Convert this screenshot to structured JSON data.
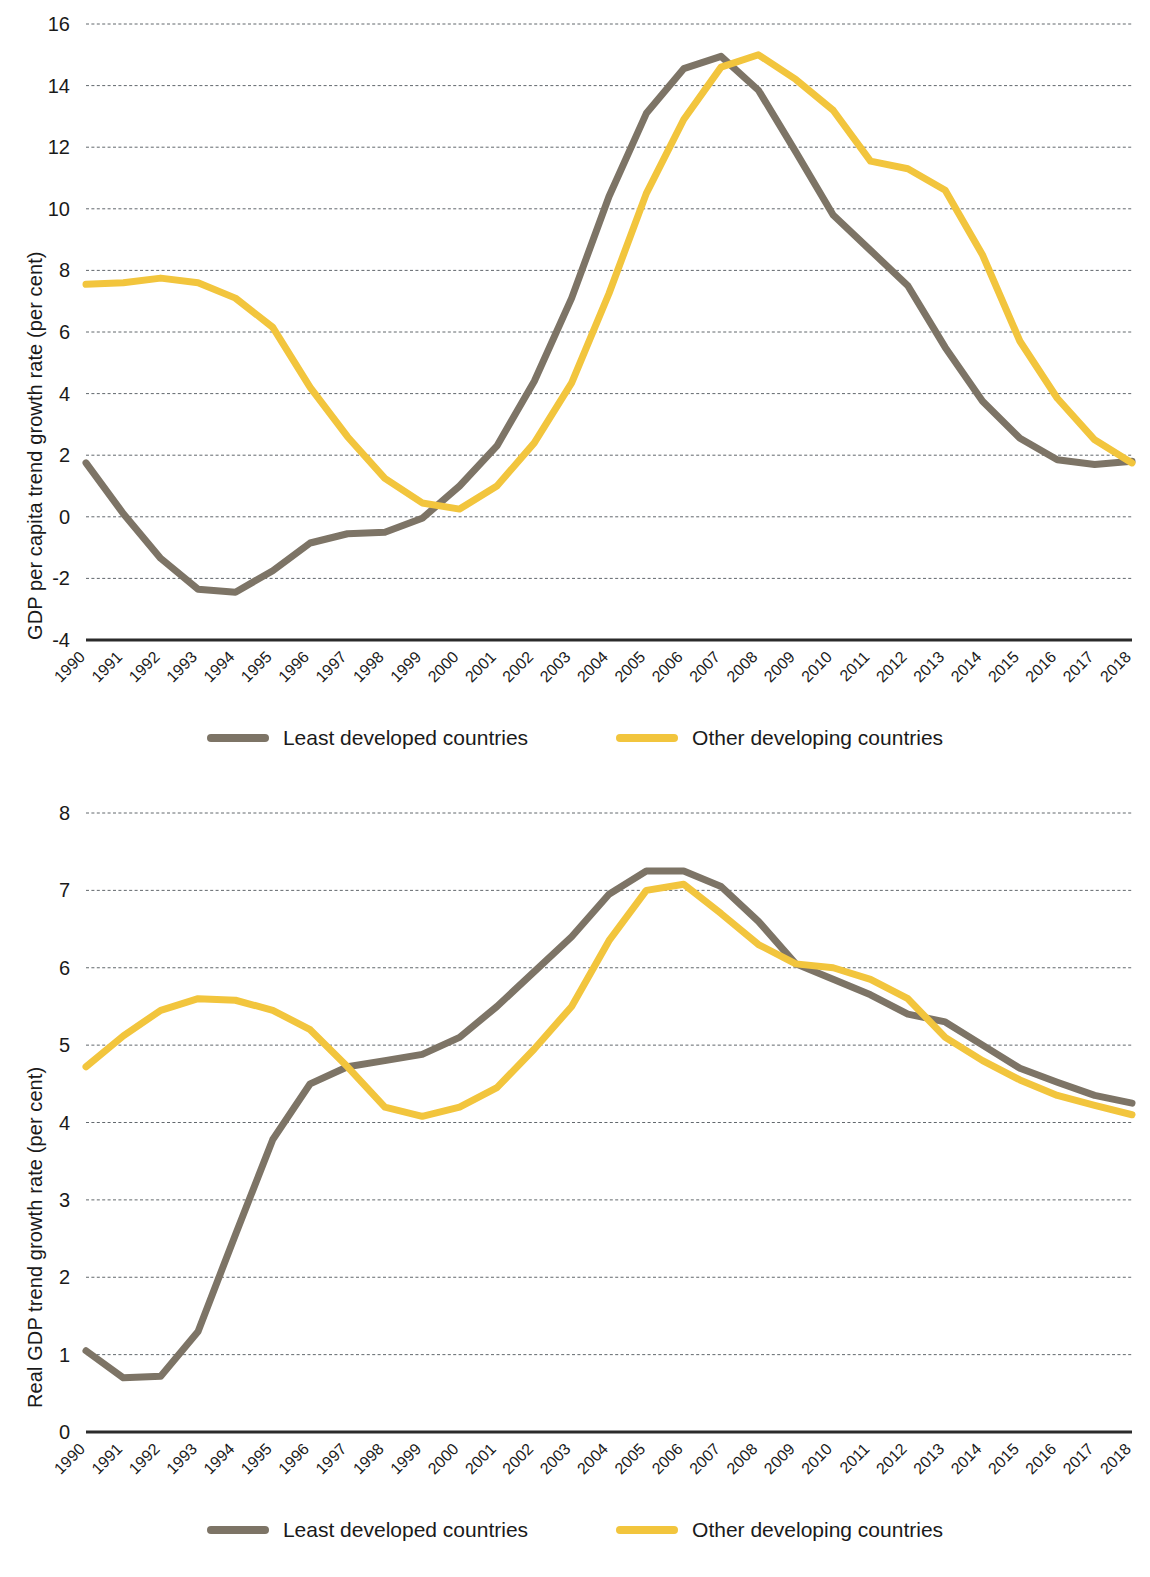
{
  "charts": [
    {
      "id": "gdp-per-capita-trend",
      "ylabel": "GDP per capita trend growth rate (per cent)",
      "yticks": [
        "16",
        "14",
        "12",
        "10",
        "8",
        "6",
        "4",
        "2",
        "0",
        "-2",
        "-4"
      ],
      "legend": [
        {
          "label": "Least developed countries",
          "color": "#7d7466"
        },
        {
          "label": "Other developing countries",
          "color": "#f2c53d"
        }
      ]
    },
    {
      "id": "real-gdp-trend",
      "ylabel": "Real GDP trend growth rate (per cent)",
      "yticks": [
        "8",
        "7",
        "6",
        "5",
        "4",
        "3",
        "2",
        "1",
        "0"
      ],
      "legend": [
        {
          "label": "Least developed countries",
          "color": "#7d7466"
        },
        {
          "label": "Other developing countries",
          "color": "#f2c53d"
        }
      ]
    }
  ],
  "colors": {
    "least_developed": "#7d7466",
    "other_developing": "#f2c53d",
    "gridline": "#5a6066",
    "axis": "#2b2b2b",
    "text": "#1a1a1a"
  },
  "chart_data": [
    {
      "type": "line",
      "title": "",
      "xlabel": "",
      "ylabel": "GDP per capita trend growth rate (per cent)",
      "grid": true,
      "legend_position": "bottom",
      "ylim": [
        -4,
        16
      ],
      "yticks": [
        -4,
        -2,
        0,
        2,
        4,
        6,
        8,
        10,
        12,
        14,
        16
      ],
      "categories": [
        "1990",
        "1991",
        "1992",
        "1993",
        "1994",
        "1995",
        "1996",
        "1997",
        "1998",
        "1999",
        "2000",
        "2001",
        "2002",
        "2003",
        "2004",
        "2005",
        "2006",
        "2007",
        "2008",
        "2009",
        "2010",
        "2011",
        "2012",
        "2013",
        "2014",
        "2015",
        "2016",
        "2017",
        "2018"
      ],
      "series": [
        {
          "name": "Least developed countries",
          "color": "#7d7466",
          "values": [
            1.75,
            0.1,
            -1.35,
            -2.35,
            -2.45,
            -1.75,
            -0.85,
            -0.55,
            -0.5,
            -0.05,
            1.0,
            2.3,
            4.4,
            7.1,
            10.4,
            13.1,
            14.55,
            14.95,
            13.85,
            11.85,
            9.8,
            8.65,
            7.5,
            5.5,
            3.75,
            2.55,
            1.85,
            1.7,
            1.8,
            1.5
          ]
        },
        {
          "name": "Other developing countries",
          "color": "#f2c53d",
          "values": [
            7.55,
            7.6,
            7.75,
            7.6,
            7.1,
            6.15,
            4.2,
            2.6,
            1.25,
            0.45,
            0.25,
            1.0,
            2.4,
            4.35,
            7.25,
            10.5,
            12.9,
            14.6,
            15.0,
            14.2,
            13.2,
            11.55,
            11.3,
            10.6,
            8.5,
            5.7,
            3.85,
            2.5,
            1.75,
            1.75,
            2.05,
            2.65
          ]
        }
      ]
    },
    {
      "type": "line",
      "title": "",
      "xlabel": "",
      "ylabel": "Real GDP trend growth rate (per cent)",
      "grid": true,
      "legend_position": "bottom",
      "ylim": [
        0,
        8
      ],
      "yticks": [
        0,
        1,
        2,
        3,
        4,
        5,
        6,
        7,
        8
      ],
      "categories": [
        "1990",
        "1991",
        "1992",
        "1993",
        "1994",
        "1995",
        "1996",
        "1997",
        "1998",
        "1999",
        "2000",
        "2001",
        "2002",
        "2003",
        "2004",
        "2005",
        "2006",
        "2007",
        "2008",
        "2009",
        "2010",
        "2011",
        "2012",
        "2013",
        "2014",
        "2015",
        "2016",
        "2017",
        "2018"
      ],
      "series": [
        {
          "name": "Least developed countries",
          "color": "#7d7466",
          "values": [
            1.05,
            0.7,
            0.72,
            1.3,
            2.55,
            3.78,
            4.5,
            4.72,
            4.8,
            4.88,
            5.1,
            5.5,
            5.95,
            6.4,
            6.95,
            7.25,
            7.25,
            7.05,
            6.6,
            6.05,
            5.85,
            5.65,
            5.4,
            5.3,
            5.0,
            4.7,
            4.52,
            4.35,
            4.25
          ]
        },
        {
          "name": "Other developing countries",
          "color": "#f2c53d",
          "values": [
            4.72,
            5.12,
            5.45,
            5.6,
            5.58,
            5.45,
            5.2,
            4.72,
            4.2,
            4.08,
            4.2,
            4.45,
            4.95,
            5.5,
            6.35,
            7.0,
            7.08,
            6.7,
            6.3,
            6.05,
            6.0,
            5.85,
            5.6,
            5.1,
            4.8,
            4.55,
            4.35,
            4.22,
            4.1
          ]
        }
      ]
    }
  ]
}
